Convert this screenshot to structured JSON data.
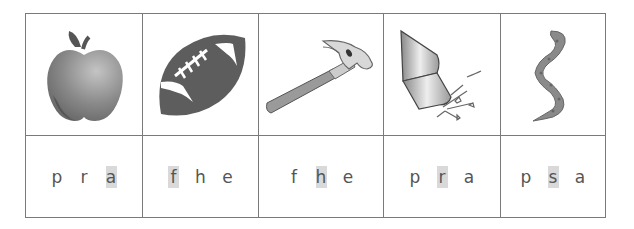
{
  "worksheet": {
    "title": "",
    "highlight_color": "#d9d9d9",
    "columns": [
      {
        "picture": "apple-icon",
        "picture_label": "apple",
        "letters": [
          "p",
          "r",
          "a"
        ],
        "highlighted_index": 2
      },
      {
        "picture": "football-icon",
        "picture_label": "football",
        "letters": [
          "f",
          "h",
          "e"
        ],
        "highlighted_index": 0
      },
      {
        "picture": "hammer-icon",
        "picture_label": "hammer",
        "letters": [
          "f",
          "h",
          "e"
        ],
        "highlighted_index": 1
      },
      {
        "picture": "rocket-icon",
        "picture_label": "rocket",
        "letters": [
          "p",
          "r",
          "a"
        ],
        "highlighted_index": 1
      },
      {
        "picture": "snake-icon",
        "picture_label": "snake",
        "letters": [
          "p",
          "s",
          "a"
        ],
        "highlighted_index": 1
      }
    ]
  }
}
